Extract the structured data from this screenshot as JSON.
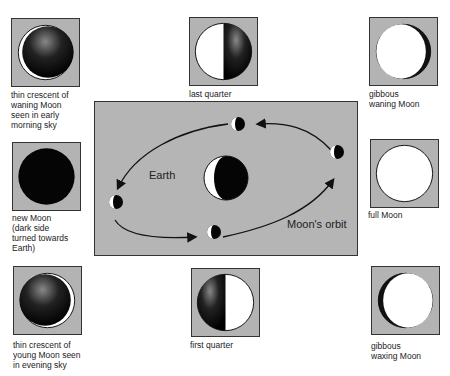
{
  "colors": {
    "panel_gray": "#b3b3b3",
    "dark": "#111111",
    "light": "#ffffff"
  },
  "phases": [
    {
      "id": "waning-crescent",
      "caption": "thin crescent of\nwaning Moon\nseen in early\nmorning sky"
    },
    {
      "id": "last-quarter",
      "caption": "last quarter"
    },
    {
      "id": "gibbous-waning",
      "caption": "gibbous\nwaning Moon"
    },
    {
      "id": "new-moon",
      "caption": "new Moon\n(dark side\nturned towards\nEarth)"
    },
    {
      "id": "full-moon",
      "caption": "full Moon"
    },
    {
      "id": "young-crescent",
      "caption": "thin crescent of\nyoung Moon seen\nin evening sky"
    },
    {
      "id": "first-quarter",
      "caption": "first quarter"
    },
    {
      "id": "gibbous-waxing",
      "caption": "gibbous\nwaxing Moon"
    }
  ],
  "orbit": {
    "earth_label": "Earth",
    "orbit_label": "Moon's orbit"
  }
}
